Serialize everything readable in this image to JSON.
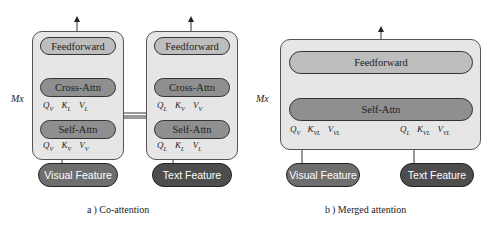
{
  "figure": {
    "repeat_label": "Mx",
    "panels": [
      {
        "id": "co-attention",
        "caption": "a ) Co-attention",
        "streams": [
          {
            "name": "visual",
            "feedforward": "Feedforward",
            "cross_attn": "Cross-Attn",
            "self_attn": "Self-Attn",
            "cross_inputs": [
              {
                "sym": "Q",
                "sub": "V"
              },
              {
                "sym": "K",
                "sub": "L"
              },
              {
                "sym": "V",
                "sub": "L"
              }
            ],
            "self_inputs": [
              {
                "sym": "Q",
                "sub": "V"
              },
              {
                "sym": "K",
                "sub": "V"
              },
              {
                "sym": "V",
                "sub": "V"
              }
            ],
            "feature": "Visual Feature"
          },
          {
            "name": "text",
            "feedforward": "Feedforward",
            "cross_attn": "Cross-Attn",
            "self_attn": "Self-Attn",
            "cross_inputs": [
              {
                "sym": "Q",
                "sub": "L"
              },
              {
                "sym": "K",
                "sub": "V"
              },
              {
                "sym": "V",
                "sub": "V"
              }
            ],
            "self_inputs": [
              {
                "sym": "Q",
                "sub": "L"
              },
              {
                "sym": "K",
                "sub": "L"
              },
              {
                "sym": "V",
                "sub": "L"
              }
            ],
            "feature": "Text Feature"
          }
        ]
      },
      {
        "id": "merged-attention",
        "caption": "b ) Merged attention",
        "feedforward": "Feedforward",
        "self_attn": "Self-Attn",
        "inputs": [
          {
            "sym": "Q",
            "sub": "V"
          },
          {
            "sym": "K",
            "sub": "VL"
          },
          {
            "sym": "V",
            "sub": "VL"
          },
          {
            "sym": "Q",
            "sub": "L"
          },
          {
            "sym": "K",
            "sub": "VL"
          },
          {
            "sym": "V",
            "sub": "VL"
          }
        ],
        "features": [
          "Visual Feature",
          "Text Feature"
        ]
      }
    ],
    "colors": {
      "panel_bg": "#e6e6e6",
      "feedforward_bg": "#bdbdbd",
      "attn_bg": "#8f8f8f",
      "visual_feature_bg": "#6e6e6e",
      "text_feature_bg": "#4d4d4d"
    }
  }
}
